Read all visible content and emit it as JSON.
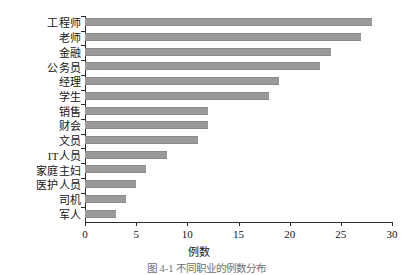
{
  "chart_data": {
    "type": "bar",
    "orientation": "horizontal",
    "title": "",
    "xlabel": "例数",
    "ylabel": "",
    "xlim": [
      0,
      30
    ],
    "xticks": [
      0,
      5,
      10,
      15,
      20,
      25,
      30
    ],
    "grid": false,
    "legend": null,
    "bar_color": "#9a9a9a",
    "categories": [
      "工程师",
      "老师",
      "金融",
      "公务员",
      "经理",
      "学生",
      "销售",
      "财会",
      "文员",
      "IT人员",
      "家庭主妇",
      "医护人员",
      "司机",
      "军人"
    ],
    "values": [
      28,
      27,
      24,
      23,
      19,
      18,
      12,
      12,
      11,
      8,
      6,
      5,
      4,
      3
    ]
  },
  "axes": {
    "x_tick_labels": [
      "0",
      "5",
      "10",
      "15",
      "20",
      "25",
      "30"
    ],
    "x_axis_title": "例数"
  },
  "caption": {
    "text": "图 4-1   不同职业的例数分布"
  },
  "colors": {
    "bar": "#9a9a9a",
    "bar_edge": "#8a8a8a",
    "axis": "#2b2b2b",
    "text": "#141414",
    "background": "#ffffff"
  }
}
